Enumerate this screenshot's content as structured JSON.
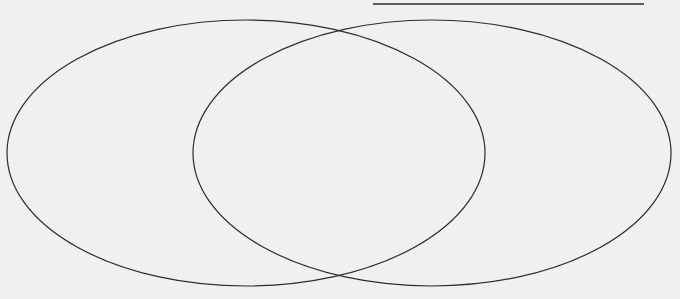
{
  "diagram": {
    "type": "venn",
    "sets": [
      {
        "id": "left",
        "label": ""
      },
      {
        "id": "right",
        "label": ""
      }
    ],
    "regions": {
      "left_only": "",
      "overlap": "",
      "right_only": ""
    },
    "title_line": "",
    "colors": {
      "stroke": "#2b2b2b",
      "paper": "#f0f0ee"
    }
  }
}
